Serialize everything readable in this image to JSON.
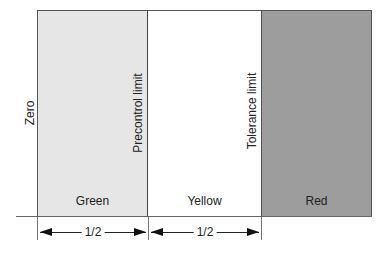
{
  "diagram": {
    "type": "precontrol-zones",
    "zones": [
      {
        "label": "Green",
        "color": "#e6e6e6"
      },
      {
        "label": "Yellow",
        "color": "#ffffff"
      },
      {
        "label": "Red",
        "color": "#9d9d9d"
      }
    ],
    "vertical_labels": {
      "zero": "Zero",
      "precontrol": "Precontrol limit",
      "tolerance": "Tolerance limit"
    },
    "dimensions": [
      {
        "label": "1/2"
      },
      {
        "label": "1/2"
      }
    ]
  }
}
